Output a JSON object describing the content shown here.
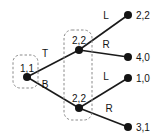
{
  "diagram": {
    "type": "extensive-form-game-tree",
    "nodes": [
      {
        "id": "root",
        "label": "1,1",
        "x": 27,
        "y": 77,
        "player": "1"
      },
      {
        "id": "upper",
        "label": "2,2",
        "x": 79,
        "y": 50,
        "player": "2"
      },
      {
        "id": "lower",
        "label": "2,2",
        "x": 79,
        "y": 108,
        "player": "2"
      }
    ],
    "information_sets": [
      {
        "id": "iset-root",
        "x": 13,
        "y": 55,
        "width": 25,
        "height": 33,
        "nodes": [
          "root"
        ]
      },
      {
        "id": "iset-player2",
        "x": 64,
        "y": 30,
        "width": 28,
        "height": 90,
        "nodes": [
          "upper",
          "lower"
        ]
      }
    ],
    "edges": [
      {
        "id": "edge-t",
        "label": "T",
        "from": "root",
        "to": "upper",
        "label_x": 45,
        "label_y": 57
      },
      {
        "id": "edge-b",
        "label": "B",
        "from": "root",
        "to": "lower",
        "label_x": 45,
        "label_y": 88
      },
      {
        "id": "edge-upper-l",
        "label": "L",
        "from": "upper",
        "to": "t1",
        "label_x": 106,
        "label_y": 19
      },
      {
        "id": "edge-upper-r",
        "label": "R",
        "from": "upper",
        "to": "t2",
        "label_x": 106,
        "label_y": 48
      },
      {
        "id": "edge-lower-l",
        "label": "L",
        "from": "lower",
        "to": "t3",
        "label_x": 106,
        "label_y": 80
      },
      {
        "id": "edge-lower-r",
        "label": "R",
        "from": "lower",
        "to": "t4",
        "label_x": 109,
        "label_y": 112
      }
    ],
    "terminals": [
      {
        "id": "t1",
        "payoff": "2,2",
        "x": 128,
        "y": 15
      },
      {
        "id": "t2",
        "payoff": "4,0",
        "x": 128,
        "y": 57
      },
      {
        "id": "t3",
        "payoff": "1,0",
        "x": 128,
        "y": 78
      },
      {
        "id": "t4",
        "payoff": "3,1",
        "x": 128,
        "y": 127
      }
    ],
    "colors": {
      "node": "#141414",
      "edge": "#1a1a1a",
      "infoset_border": "#8a8a8a",
      "background": "#ffffff",
      "text": "#141414"
    }
  }
}
